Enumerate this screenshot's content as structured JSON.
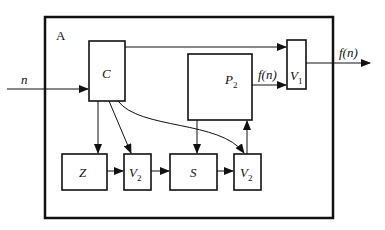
{
  "diagram": {
    "container_label": "A",
    "input_label": "n",
    "output_label": "f(n)",
    "blocks": {
      "C": {
        "label": "C"
      },
      "P2": {
        "label": "P",
        "sub": "2"
      },
      "V1": {
        "label": "V",
        "sub": "1"
      },
      "Z": {
        "label": "Z"
      },
      "V2a": {
        "label": "V",
        "sub": "2"
      },
      "S": {
        "label": "S"
      },
      "V2b": {
        "label": "V",
        "sub": "2"
      }
    },
    "edge_labels": {
      "P2_to_V1": "f(n)"
    },
    "edges": [
      {
        "from": "input",
        "to": "C",
        "label": "n"
      },
      {
        "from": "C",
        "to": "V1"
      },
      {
        "from": "P2",
        "to": "V1",
        "label": "f(n)"
      },
      {
        "from": "V1",
        "to": "output",
        "label": "f(n)"
      },
      {
        "from": "C",
        "to": "Z"
      },
      {
        "from": "C",
        "to": "V2a"
      },
      {
        "from": "C",
        "to": "V2b"
      },
      {
        "from": "Z",
        "to": "V2a"
      },
      {
        "from": "V2a",
        "to": "S"
      },
      {
        "from": "P2",
        "to": "S"
      },
      {
        "from": "S",
        "to": "V2b"
      },
      {
        "from": "V2b",
        "to": "P2"
      }
    ]
  }
}
